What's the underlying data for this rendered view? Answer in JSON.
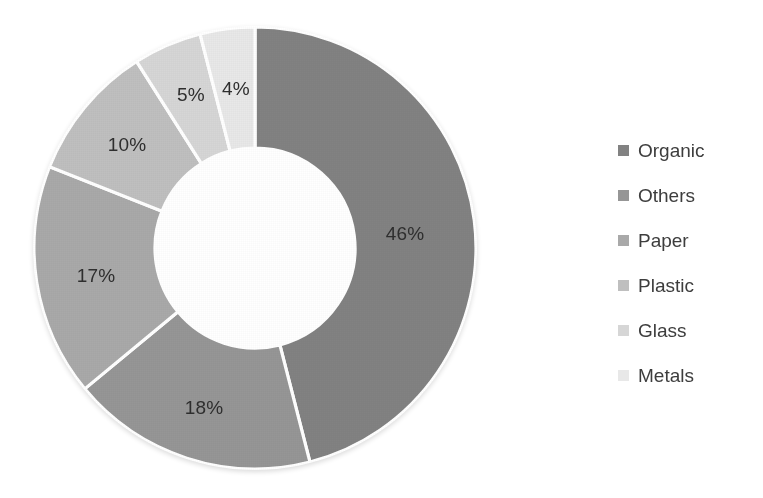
{
  "chart_data": {
    "type": "pie",
    "variant": "donut",
    "title": "",
    "subtitle": "",
    "xlabel": "",
    "ylabel": "",
    "grid": false,
    "legend_position": "right",
    "start_angle_oclock": 12,
    "direction": "clockwise",
    "value_unit": "%",
    "categories": [
      "Organic",
      "Others",
      "Paper",
      "Plastic",
      "Glass",
      "Metals"
    ],
    "values": [
      46,
      18,
      17,
      10,
      5,
      4
    ],
    "labels": [
      "46%",
      "18%",
      "17%",
      "10%",
      "5%",
      "4%"
    ],
    "colors": [
      "#828282",
      "#969696",
      "#a9a9a9",
      "#bfbfbf",
      "#d6d6d6",
      "#e8e8e8"
    ],
    "slices": [
      {
        "name": "Organic",
        "value": 46,
        "label": "46%",
        "color": "#828282"
      },
      {
        "name": "Others",
        "value": 18,
        "label": "18%",
        "color": "#969696"
      },
      {
        "name": "Paper",
        "value": 17,
        "label": "17%",
        "color": "#a9a9a9"
      },
      {
        "name": "Plastic",
        "value": 10,
        "label": "10%",
        "color": "#bfbfbf"
      },
      {
        "name": "Glass",
        "value": 5,
        "label": "5%",
        "color": "#d6d6d6"
      },
      {
        "name": "Metals",
        "value": 4,
        "label": "4%",
        "color": "#e8e8e8"
      }
    ]
  },
  "labels": {
    "organic": "46%",
    "others": "18%",
    "paper": "17%",
    "plastic": "10%",
    "glass": "5%",
    "metals": "4%"
  },
  "legend": {
    "items": [
      {
        "label": "Organic",
        "color": "#828282"
      },
      {
        "label": "Others",
        "color": "#969696"
      },
      {
        "label": "Paper",
        "color": "#a9a9a9"
      },
      {
        "label": "Plastic",
        "color": "#bfbfbf"
      },
      {
        "label": "Glass",
        "color": "#d6d6d6"
      },
      {
        "label": "Metals",
        "color": "#e8e8e8"
      }
    ]
  }
}
